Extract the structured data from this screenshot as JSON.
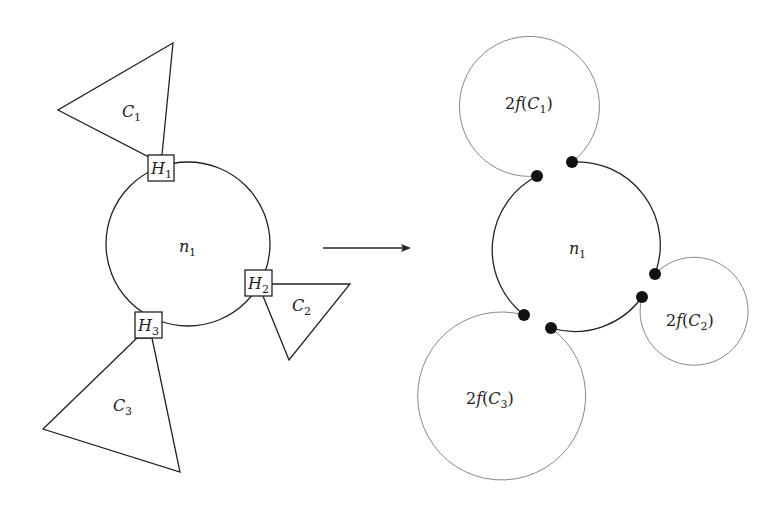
{
  "left": {
    "node": {
      "label": "n",
      "sub": "1"
    },
    "hubs": [
      {
        "label": "H",
        "sub": "1"
      },
      {
        "label": "H",
        "sub": "2"
      },
      {
        "label": "H",
        "sub": "3"
      }
    ],
    "components": [
      {
        "label": "C",
        "sub": "1"
      },
      {
        "label": "C",
        "sub": "2"
      },
      {
        "label": "C",
        "sub": "3"
      }
    ]
  },
  "right": {
    "node": {
      "label": "n",
      "sub": "1"
    },
    "circles": [
      {
        "prefix": "2",
        "fn": "f",
        "open": "(",
        "label": "C",
        "sub": "1",
        "close": ")"
      },
      {
        "prefix": "2",
        "fn": "f",
        "open": "(",
        "label": "C",
        "sub": "2",
        "close": ")"
      },
      {
        "prefix": "2",
        "fn": "f",
        "open": "(",
        "label": "C",
        "sub": "3",
        "close": ")"
      }
    ]
  },
  "arrow": {
    "direction": "right"
  }
}
